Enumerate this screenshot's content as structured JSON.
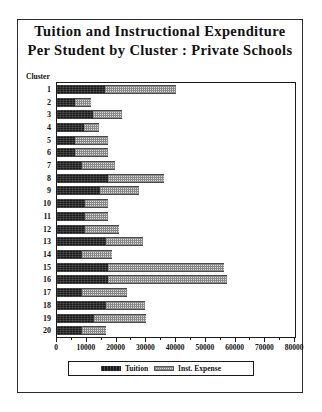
{
  "title": {
    "line1": "Tuition and Instructional Expenditure",
    "line2": "Per Student by Cluster : Private Schools"
  },
  "axes": {
    "y_caption": "Cluster",
    "x_ticklabels": [
      "0",
      "10000",
      "20000",
      "30000",
      "40000",
      "50000",
      "60000",
      "70000",
      "80000"
    ]
  },
  "legend": {
    "tuition_label": "Tuition",
    "expense_label": "Inst. Expense"
  },
  "colors": {
    "tuition": "#1b1b1b",
    "expense": "#d9d9d9",
    "frame": "#1a1a1a",
    "text": "#111111",
    "background": "#ffffff"
  },
  "chart_data": {
    "type": "bar",
    "orientation": "horizontal",
    "stacked": true,
    "title": "Tuition and Instructional Expenditure Per Student by Cluster : Private Schools",
    "xlabel": "",
    "ylabel": "Cluster",
    "xlim": [
      0,
      80000
    ],
    "xticks": [
      0,
      10000,
      20000,
      30000,
      40000,
      50000,
      60000,
      70000,
      80000
    ],
    "grid": false,
    "legend_position": "bottom",
    "categories": [
      "1",
      "2",
      "3",
      "4",
      "5",
      "6",
      "7",
      "8",
      "9",
      "10",
      "11",
      "12",
      "13",
      "14",
      "15",
      "16",
      "17",
      "18",
      "19",
      "20"
    ],
    "series": [
      {
        "name": "Tuition",
        "color": "#1b1b1b",
        "values": [
          16000,
          6000,
          12000,
          9000,
          6000,
          6000,
          8500,
          17000,
          14500,
          9500,
          9500,
          9500,
          16500,
          8500,
          17000,
          17000,
          8500,
          16500,
          12500,
          8500
        ]
      },
      {
        "name": "Inst. Expense",
        "color": "#d9d9d9",
        "values": [
          24000,
          5500,
          10000,
          5000,
          11000,
          11000,
          11000,
          19000,
          13000,
          7500,
          7500,
          11500,
          12500,
          10000,
          39000,
          40000,
          15000,
          13000,
          17500,
          8000
        ]
      }
    ],
    "totals": [
      40000,
      11500,
      22000,
      14000,
      17000,
      17000,
      19500,
      36000,
      27500,
      17000,
      17000,
      21000,
      29000,
      18500,
      56000,
      57000,
      23500,
      29500,
      30000,
      16500
    ]
  }
}
